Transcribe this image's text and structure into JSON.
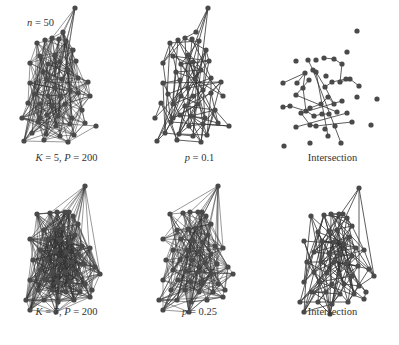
{
  "figure": {
    "n_label": "n = 50",
    "node_color": "#4a4a4a",
    "edge_color": "#333333",
    "panels": [
      {
        "id": "k5",
        "row": 0,
        "col": 0,
        "label": "K = 5, P = 200",
        "density": 0.22,
        "seed": 11
      },
      {
        "id": "p01",
        "row": 0,
        "col": 1,
        "label": "p = 0.1",
        "density": 0.1,
        "seed": 23
      },
      {
        "id": "int1",
        "row": 0,
        "col": 2,
        "label": "Intersection",
        "density": 0.018,
        "seed": 37
      },
      {
        "id": "k7",
        "row": 1,
        "col": 0,
        "label": "K = 7, P = 200",
        "density": 0.42,
        "seed": 41
      },
      {
        "id": "p025",
        "row": 1,
        "col": 1,
        "label": "p = 0.25",
        "density": 0.25,
        "seed": 53
      },
      {
        "id": "int2",
        "row": 1,
        "col": 2,
        "label": "Intersection",
        "density": 0.1,
        "seed": 67
      }
    ]
  },
  "nodes": {
    "top": [
      [
        75,
        8
      ],
      [
        63,
        32
      ],
      [
        37,
        43
      ],
      [
        45,
        40
      ],
      [
        52,
        38
      ],
      [
        59,
        39
      ],
      [
        66,
        41
      ],
      [
        73,
        50
      ],
      [
        40,
        56
      ],
      [
        55,
        55
      ],
      [
        30,
        63
      ],
      [
        48,
        64
      ],
      [
        60,
        62
      ],
      [
        76,
        61
      ],
      [
        43,
        72
      ],
      [
        68,
        70
      ],
      [
        78,
        78
      ],
      [
        88,
        82
      ],
      [
        47,
        80
      ],
      [
        62,
        79
      ],
      [
        30,
        83
      ],
      [
        55,
        88
      ],
      [
        70,
        90
      ],
      [
        35,
        94
      ],
      [
        48,
        96
      ],
      [
        60,
        96
      ],
      [
        78,
        93
      ],
      [
        90,
        96
      ],
      [
        40,
        104
      ],
      [
        52,
        106
      ],
      [
        65,
        104
      ],
      [
        82,
        110
      ],
      [
        47,
        115
      ],
      [
        58,
        116
      ],
      [
        72,
        118
      ],
      [
        38,
        122
      ],
      [
        56,
        126
      ],
      [
        70,
        124
      ],
      [
        85,
        123
      ],
      [
        32,
        133
      ],
      [
        46,
        134
      ],
      [
        60,
        136
      ],
      [
        74,
        135
      ],
      [
        24,
        141
      ],
      [
        44,
        140
      ],
      [
        96,
        126
      ],
      [
        68,
        142
      ],
      [
        22,
        118
      ],
      [
        28,
        103
      ],
      [
        40,
        118
      ]
    ],
    "bottom": [
      [
        85,
        14
      ],
      [
        69,
        40
      ],
      [
        37,
        42
      ],
      [
        50,
        41
      ],
      [
        57,
        40
      ],
      [
        65,
        40
      ],
      [
        73,
        44
      ],
      [
        78,
        52
      ],
      [
        44,
        58
      ],
      [
        55,
        57
      ],
      [
        63,
        56
      ],
      [
        75,
        63
      ],
      [
        30,
        67
      ],
      [
        48,
        67
      ],
      [
        60,
        68
      ],
      [
        70,
        70
      ],
      [
        82,
        74
      ],
      [
        90,
        76
      ],
      [
        40,
        78
      ],
      [
        55,
        79
      ],
      [
        66,
        80
      ],
      [
        78,
        82
      ],
      [
        33,
        88
      ],
      [
        47,
        88
      ],
      [
        60,
        88
      ],
      [
        72,
        90
      ],
      [
        84,
        92
      ],
      [
        95,
        95
      ],
      [
        40,
        98
      ],
      [
        53,
        99
      ],
      [
        65,
        100
      ],
      [
        78,
        102
      ],
      [
        30,
        108
      ],
      [
        45,
        108
      ],
      [
        58,
        110
      ],
      [
        70,
        110
      ],
      [
        85,
        112
      ],
      [
        100,
        102
      ],
      [
        38,
        118
      ],
      [
        52,
        118
      ],
      [
        66,
        120
      ],
      [
        80,
        120
      ],
      [
        92,
        118
      ],
      [
        26,
        128
      ],
      [
        44,
        128
      ],
      [
        58,
        130
      ],
      [
        74,
        128
      ],
      [
        90,
        125
      ],
      [
        30,
        138
      ],
      [
        56,
        140
      ]
    ]
  },
  "intersection_top": {
    "nodes": [
      [
        91,
        31
      ],
      [
        81,
        52
      ],
      [
        30,
        61
      ],
      [
        42,
        60
      ],
      [
        50,
        60
      ],
      [
        58,
        58
      ],
      [
        68,
        59
      ],
      [
        76,
        64
      ],
      [
        17,
        83
      ],
      [
        31,
        83
      ],
      [
        43,
        80
      ],
      [
        47,
        70
      ],
      [
        50,
        72
      ],
      [
        60,
        76
      ],
      [
        74,
        82
      ],
      [
        80,
        79
      ],
      [
        84,
        79
      ],
      [
        93,
        86
      ],
      [
        37,
        88
      ],
      [
        59,
        87
      ],
      [
        30,
        95
      ],
      [
        66,
        82
      ],
      [
        91,
        97
      ],
      [
        111,
        99
      ],
      [
        17,
        107
      ],
      [
        24,
        106
      ],
      [
        44,
        108
      ],
      [
        55,
        104
      ],
      [
        62,
        97
      ],
      [
        68,
        104
      ],
      [
        76,
        101
      ],
      [
        35,
        113
      ],
      [
        40,
        111
      ],
      [
        48,
        116
      ],
      [
        56,
        114
      ],
      [
        63,
        114
      ],
      [
        71,
        112
      ],
      [
        81,
        113
      ],
      [
        30,
        127
      ],
      [
        44,
        125
      ],
      [
        50,
        126
      ],
      [
        59,
        129
      ],
      [
        69,
        126
      ],
      [
        86,
        122
      ],
      [
        105,
        125
      ],
      [
        62,
        136
      ],
      [
        18,
        146
      ],
      [
        44,
        143
      ],
      [
        75,
        143
      ],
      [
        39,
        73
      ]
    ],
    "edges": [
      [
        42,
        0
      ],
      [
        0,
        0
      ]
    ]
  }
}
